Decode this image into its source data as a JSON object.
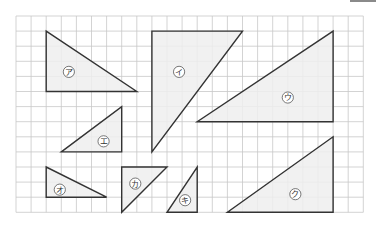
{
  "figure": {
    "grid": {
      "origin_x": 16,
      "origin_y": 16,
      "cell": 15.1,
      "cols": 23,
      "rows": 13,
      "line_color": "#c8c8c8",
      "border_color": "#bdbdbd"
    },
    "style": {
      "stroke": "#333333",
      "fill": "#eeeeee",
      "label_circle": "#555555"
    },
    "triangles": [
      {
        "id": "a",
        "label": "ア",
        "points": [
          [
            2,
            1
          ],
          [
            2,
            5
          ],
          [
            8,
            5
          ]
        ],
        "label_at": [
          3.5,
          3.7
        ]
      },
      {
        "id": "i",
        "label": "イ",
        "points": [
          [
            9,
            1
          ],
          [
            15,
            1
          ],
          [
            9,
            9
          ]
        ],
        "label_at": [
          10.8,
          3.7
        ]
      },
      {
        "id": "u",
        "label": "ウ",
        "points": [
          [
            21,
            1
          ],
          [
            21,
            7
          ],
          [
            12,
            7
          ]
        ],
        "label_at": [
          18,
          5.4
        ]
      },
      {
        "id": "e",
        "label": "エ",
        "points": [
          [
            7,
            6
          ],
          [
            7,
            9
          ],
          [
            3,
            9
          ]
        ],
        "label_at": [
          5.8,
          8.3
        ]
      },
      {
        "id": "o",
        "label": "オ",
        "points": [
          [
            2,
            10
          ],
          [
            2,
            12
          ],
          [
            6,
            12
          ]
        ],
        "label_at": [
          2.9,
          11.5
        ]
      },
      {
        "id": "ka",
        "label": "カ",
        "points": [
          [
            7,
            10
          ],
          [
            10,
            10
          ],
          [
            7,
            13
          ]
        ],
        "label_at": [
          7.9,
          11.1
        ]
      },
      {
        "id": "ki",
        "label": "キ",
        "points": [
          [
            12,
            10
          ],
          [
            12,
            13
          ],
          [
            10,
            13
          ]
        ],
        "label_at": [
          11.2,
          12.2
        ]
      },
      {
        "id": "ku",
        "label": "ク",
        "points": [
          [
            21,
            8
          ],
          [
            21,
            13
          ],
          [
            14,
            13
          ]
        ],
        "label_at": [
          18.5,
          11.8
        ]
      }
    ]
  }
}
